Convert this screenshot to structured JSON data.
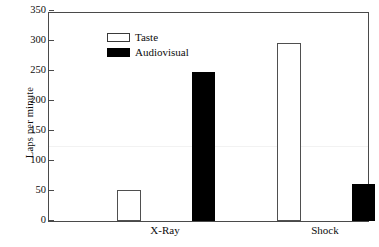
{
  "chart_data": {
    "type": "bar",
    "title": "",
    "xlabel": "",
    "ylabel": "Laps per minute",
    "categories": [
      "X-Ray",
      "Shock"
    ],
    "series": [
      {
        "name": "Taste",
        "color": "#ffffff",
        "edge": "#4f4f4f",
        "values": [
          52,
          297
        ]
      },
      {
        "name": "Audiovisual",
        "color": "#000000",
        "edge": "#000000",
        "values": [
          248,
          62
        ]
      }
    ],
    "ylim": [
      0,
      350
    ],
    "yticks": [
      0,
      50,
      100,
      150,
      200,
      250,
      300,
      350
    ],
    "ytick_labels": [
      "0",
      "50",
      "100",
      "150",
      "200",
      "250",
      "300",
      "350"
    ],
    "grid": false,
    "legend_position": "top-left",
    "frame": true
  },
  "legend": {
    "items": [
      {
        "label": "Taste",
        "swatch": "open-square-swatch"
      },
      {
        "label": "Audiovisual",
        "swatch": "filled-square-swatch"
      }
    ]
  },
  "axes": {
    "y_title": "Laps per minute"
  }
}
